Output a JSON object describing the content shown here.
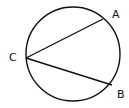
{
  "diagram": {
    "type": "circle-with-chords",
    "circle": {
      "cx": 73,
      "cy": 54,
      "r": 47
    },
    "points": [
      {
        "id": "C",
        "label": "C",
        "x": 26,
        "y": 58,
        "label_x": 9,
        "label_y": 61
      },
      {
        "id": "A",
        "label": "A",
        "x": 103,
        "y": 19,
        "label_x": 112,
        "label_y": 18
      },
      {
        "id": "B",
        "label": "B",
        "x": 112,
        "y": 85,
        "label_x": 117,
        "label_y": 98
      }
    ],
    "chords": [
      {
        "from": "C",
        "to": "A"
      },
      {
        "from": "C",
        "to": "B"
      }
    ],
    "stroke_color": "#111111"
  }
}
